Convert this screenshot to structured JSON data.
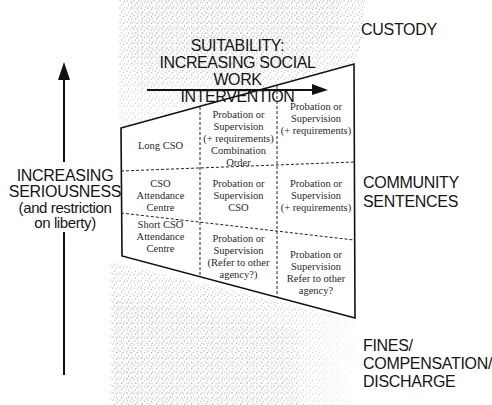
{
  "heading": {
    "line1": "SUITABILITY:",
    "line2": "INCREASING SOCIAL WORK",
    "line3": "INTERVENTION"
  },
  "left_axis": {
    "line1": "INCREASING",
    "line2": "SERIOUSNESS",
    "line3": "(and restriction",
    "line4": "on liberty)"
  },
  "right_labels": {
    "custody": "CUSTODY",
    "community_line1": "COMMUNITY",
    "community_line2": "SENTENCES",
    "fines_line1": "FINES/",
    "fines_line2": "COMPENSATION/",
    "fines_line3": "DISCHARGE"
  },
  "grid": {
    "rows": [
      {
        "cells": [
          {
            "lines": [
              "Long CSO"
            ]
          },
          {
            "lines": [
              "Probation or",
              "Supervision",
              "(+ requirements)",
              "Combination",
              "Order"
            ]
          },
          {
            "lines": [
              "Probation or",
              "Supervision",
              "(+ requirements)"
            ]
          }
        ]
      },
      {
        "cells": [
          {
            "lines": [
              "CSO",
              "Attendance",
              "Centre"
            ]
          },
          {
            "lines": [
              "Probation or",
              "Supervision",
              "CSO"
            ]
          },
          {
            "lines": [
              "Probation or",
              "Supervision",
              "(+ requirements)"
            ]
          }
        ]
      },
      {
        "cells": [
          {
            "lines": [
              "Short CSO",
              "Attendance",
              "Centre"
            ]
          },
          {
            "lines": [
              "Probation or",
              "Supervision",
              "(Refer to other",
              "agency?)"
            ]
          },
          {
            "lines": [
              "Probation or",
              "Supervision",
              "Refer to other",
              "agency?"
            ]
          }
        ]
      }
    ]
  },
  "colors": {
    "ink": "#111111",
    "stipple": "#9a9a9a"
  }
}
